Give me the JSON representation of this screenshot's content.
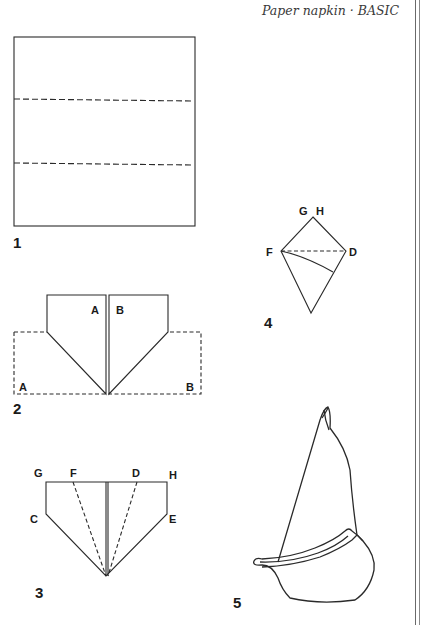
{
  "header": {
    "title": "Paper napkin · BASIC"
  },
  "figures": [
    {
      "step": "1",
      "labels": []
    },
    {
      "step": "2",
      "labels": [
        "A",
        "B",
        "A",
        "B"
      ]
    },
    {
      "step": "3",
      "labels": [
        "G",
        "F",
        "D",
        "H",
        "C",
        "E"
      ]
    },
    {
      "step": "4",
      "labels": [
        "G",
        "H",
        "F",
        "D"
      ]
    },
    {
      "step": "5",
      "labels": []
    }
  ],
  "colors": {
    "line": "#2a2a2a",
    "text": "#1a1a1a",
    "background": "#ffffff"
  }
}
